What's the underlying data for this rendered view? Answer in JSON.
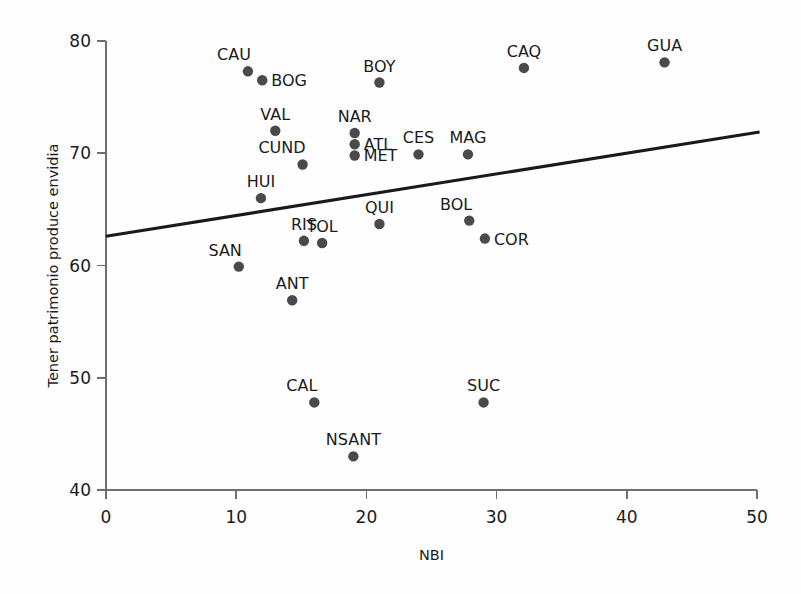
{
  "chart_data": {
    "type": "scatter",
    "title": "",
    "xlabel": "NBI",
    "ylabel": "Tener patrimonio produce envidia",
    "xlim": [
      0,
      50
    ],
    "ylim": [
      40,
      80
    ],
    "xticks": [
      0,
      10,
      20,
      30,
      40,
      50
    ],
    "yticks": [
      40,
      50,
      60,
      70,
      80
    ],
    "xtick_labels": [
      "0",
      "10",
      "20",
      "30",
      "40",
      "50"
    ],
    "ytick_labels": [
      "40",
      "50",
      "60",
      "70",
      "80"
    ],
    "grid": false,
    "legend": null,
    "marker_color": "#4a4a4a",
    "line_color": "#1a1a1a",
    "axis_color": "#6f6f6f",
    "points": [
      {
        "label": "CAU",
        "x": 10.9,
        "y": 77.3,
        "pos": "above-left"
      },
      {
        "label": "BOG",
        "x": 12.0,
        "y": 76.5,
        "pos": "right"
      },
      {
        "label": "VAL",
        "x": 13.0,
        "y": 72.0,
        "pos": "above"
      },
      {
        "label": "CUND",
        "x": 15.1,
        "y": 69.0,
        "pos": "above-left"
      },
      {
        "label": "HUI",
        "x": 11.9,
        "y": 66.0,
        "pos": "above"
      },
      {
        "label": "SAN",
        "x": 10.2,
        "y": 59.9,
        "pos": "above-left"
      },
      {
        "label": "ANT",
        "x": 14.3,
        "y": 56.9,
        "pos": "above"
      },
      {
        "label": "RIS",
        "x": 15.2,
        "y": 62.2,
        "pos": "above"
      },
      {
        "label": "TOL",
        "x": 16.6,
        "y": 62.0,
        "pos": "above"
      },
      {
        "label": "CAL",
        "x": 16.0,
        "y": 47.8,
        "pos": "above-left"
      },
      {
        "label": "NSANT",
        "x": 19.0,
        "y": 43.0,
        "pos": "above"
      },
      {
        "label": "NAR",
        "x": 19.1,
        "y": 71.8,
        "pos": "above"
      },
      {
        "label": "ATL",
        "x": 19.1,
        "y": 70.8,
        "pos": "right"
      },
      {
        "label": "MET",
        "x": 19.1,
        "y": 69.8,
        "pos": "right"
      },
      {
        "label": "BOY",
        "x": 21.0,
        "y": 76.3,
        "pos": "above"
      },
      {
        "label": "QUI",
        "x": 21.0,
        "y": 63.7,
        "pos": "above"
      },
      {
        "label": "CES",
        "x": 24.0,
        "y": 69.9,
        "pos": "above"
      },
      {
        "label": "MAG",
        "x": 27.8,
        "y": 69.9,
        "pos": "above"
      },
      {
        "label": "BOL",
        "x": 27.9,
        "y": 64.0,
        "pos": "above-left"
      },
      {
        "label": "COR",
        "x": 29.1,
        "y": 62.4,
        "pos": "right"
      },
      {
        "label": "SUC",
        "x": 29.0,
        "y": 47.8,
        "pos": "above"
      },
      {
        "label": "CAQ",
        "x": 32.1,
        "y": 77.6,
        "pos": "above"
      },
      {
        "label": "GUA",
        "x": 42.9,
        "y": 78.1,
        "pos": "above"
      }
    ],
    "trend_line": {
      "x0": 0.0,
      "y0": 62.6,
      "x1": 50.2,
      "y1": 71.9
    }
  }
}
